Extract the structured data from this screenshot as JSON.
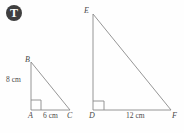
{
  "badge": {
    "glyph": "T",
    "color": "#3f3f3f",
    "glyph_color": "#ffffff"
  },
  "stroke_color": "#8a8a8a",
  "background_color": "#fefefe",
  "text_color": "#4a4a4a",
  "figure": {
    "triangles": [
      {
        "name": "triangle-abc",
        "vertices": [
          {
            "label": "B",
            "x": 31,
            "y": 62
          },
          {
            "label": "A",
            "x": 31,
            "y": 110
          },
          {
            "label": "C",
            "x": 70,
            "y": 110
          }
        ],
        "right_angle_at": "A",
        "measurements": [
          {
            "label": "8 cm",
            "side": "AB",
            "value": 8,
            "unit": "cm"
          },
          {
            "label": "6 cm",
            "side": "AC",
            "value": 6,
            "unit": "cm"
          }
        ]
      },
      {
        "name": "triangle-def",
        "vertices": [
          {
            "label": "E",
            "x": 93,
            "y": 14
          },
          {
            "label": "D",
            "x": 93,
            "y": 110
          },
          {
            "label": "F",
            "x": 171,
            "y": 110
          }
        ],
        "right_angle_at": "D",
        "measurements": [
          {
            "label": "12 cm",
            "side": "DF",
            "value": 12,
            "unit": "cm"
          }
        ]
      }
    ],
    "labels": {
      "B": "B",
      "A": "A",
      "C": "C",
      "E": "E",
      "D": "D",
      "F": "F",
      "side_ab": "8 cm",
      "side_ac": "6 cm",
      "side_df": "12 cm"
    }
  }
}
